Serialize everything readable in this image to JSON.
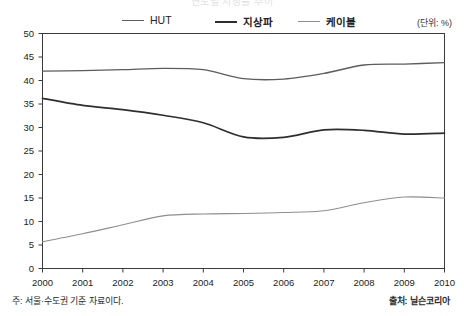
{
  "title_faint": "연도별 시청률 추이",
  "unit_label": "(단위: %)",
  "legend": {
    "items": [
      {
        "label": "HUT",
        "color": "#5c5c5c"
      },
      {
        "label": "지상파",
        "color": "#2e2e2e"
      },
      {
        "label": "케이블",
        "color": "#8e8e8e"
      }
    ]
  },
  "footnote": "주: 서울·수도권 기준 자료이다.",
  "source": "출처: 닐슨코리아",
  "axis": {
    "y_ticks": [
      "50",
      "45",
      "40",
      "35",
      "30",
      "25",
      "20",
      "15",
      "10",
      "5",
      "0"
    ],
    "x_ticks": [
      "2000",
      "2001",
      "2002",
      "2003",
      "2004",
      "2005",
      "2006",
      "2007",
      "2008",
      "2009",
      "2010"
    ]
  },
  "chart_data": {
    "type": "line",
    "title": "연도별 시청률 추이",
    "xlabel": "",
    "ylabel": "",
    "unit": "%",
    "grid": false,
    "legend_position": "top-center",
    "ylim": [
      0,
      50
    ],
    "ytick_step": 5,
    "categories": [
      "2000",
      "2001",
      "2002",
      "2003",
      "2004",
      "2005",
      "2006",
      "2007",
      "2008",
      "2009",
      "2010"
    ],
    "series": [
      {
        "name": "HUT",
        "color": "#5c5c5c",
        "values": [
          42.0,
          42.1,
          42.3,
          42.6,
          42.3,
          40.4,
          40.3,
          41.5,
          43.3,
          43.5,
          43.8
        ]
      },
      {
        "name": "지상파",
        "color": "#2e2e2e",
        "values": [
          36.2,
          34.7,
          33.8,
          32.6,
          31.0,
          28.0,
          27.9,
          29.5,
          29.4,
          28.6,
          28.8
        ]
      },
      {
        "name": "케이블",
        "color": "#8e8e8e",
        "values": [
          5.7,
          7.4,
          9.3,
          11.2,
          11.6,
          11.7,
          11.9,
          12.3,
          14.0,
          15.2,
          15.0
        ]
      }
    ],
    "notes": "주: 서울·수도권 기준 자료이다.",
    "source": "출처: 닐슨코리아"
  }
}
